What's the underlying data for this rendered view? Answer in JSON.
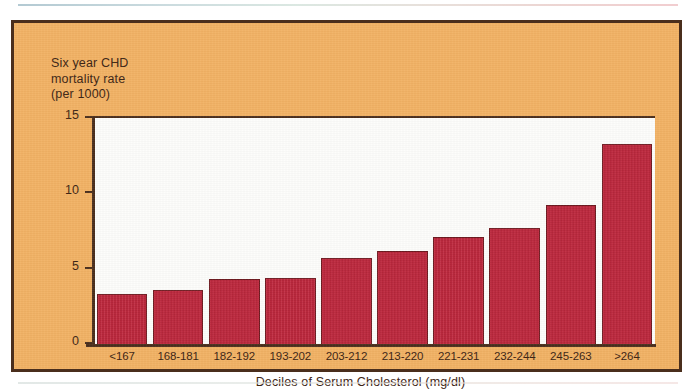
{
  "figure": {
    "plate_color": "#f2b264",
    "border_color": "#4a2e1c",
    "bar_color": "#c22138",
    "bar_edge_color": "#6e1a20",
    "plot_background": "#fdfdfb"
  },
  "chart_data": {
    "type": "bar",
    "title": "",
    "ylabel": "Six year CHD\nmortality rate\n(per 1000)",
    "xlabel": "Deciles of Serum Cholesterol (mg/dl)",
    "categories": [
      "<167",
      "168-181",
      "182-192",
      "193-202",
      "203-212",
      "213-220",
      "221-231",
      "232-244",
      "245-263",
      ">264"
    ],
    "values": [
      3.3,
      3.6,
      4.3,
      4.4,
      5.7,
      6.2,
      7.1,
      7.7,
      9.2,
      13.3
    ],
    "ylim": [
      0,
      15
    ],
    "yticks": [
      0,
      5,
      10,
      15
    ],
    "ytick_labels": [
      "0",
      "5",
      "10",
      "15"
    ],
    "grid": false,
    "legend": null
  }
}
